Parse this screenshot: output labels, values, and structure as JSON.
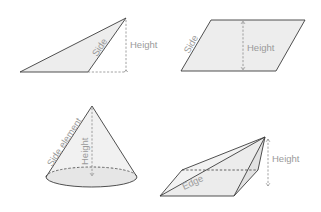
{
  "figures": {
    "triangle": {
      "side_label": "Side",
      "height_label": "Height"
    },
    "parallelogram": {
      "side_label": "Side",
      "height_label": "Height"
    },
    "cone": {
      "side_element_label": "Side element",
      "height_label": "Height"
    },
    "pyramid": {
      "edge_label": "Edge",
      "height_label": "Height"
    }
  },
  "colors": {
    "outline": "#3c3c3c",
    "fill": "#ededed",
    "label": "#9a9a9a",
    "guide": "#8a8a8a"
  }
}
